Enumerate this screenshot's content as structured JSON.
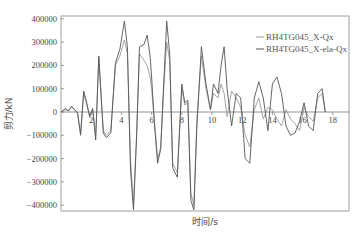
{
  "chart_data": {
    "type": "line",
    "title": "",
    "xlabel": "时间/s",
    "ylabel": "剪力/kN",
    "xlim": [
      0,
      19
    ],
    "ylim": [
      -450000,
      410000
    ],
    "x_ticks": [
      "2",
      "4",
      "6",
      "8",
      "10",
      "12",
      "14",
      "16",
      "18"
    ],
    "y_ticks": [
      "400000",
      "300000",
      "200000",
      "100000",
      "0",
      "-100000",
      "-200000",
      "-300000",
      "-400000"
    ],
    "grid": false,
    "legend_position": "upper right",
    "series": [
      {
        "name": "RH4TG045_X-Qx",
        "color": "#9a9a9a",
        "x": [
          0,
          0.3,
          0.5,
          0.7,
          0.9,
          1.1,
          1.3,
          1.5,
          1.7,
          1.9,
          2.1,
          2.3,
          2.5,
          2.8,
          3.0,
          3.3,
          3.6,
          3.9,
          4.2,
          4.4,
          4.6,
          4.8,
          5.0,
          5.2,
          5.5,
          5.7,
          5.9,
          6.0,
          6.2,
          6.4,
          6.6,
          6.8,
          7.0,
          7.2,
          7.4,
          7.7,
          8.0,
          8.2,
          8.4,
          8.6,
          8.8,
          9.0,
          9.3,
          9.6,
          9.9,
          10.1,
          10.4,
          10.6,
          10.8,
          11.0,
          11.3,
          11.6,
          11.9,
          12.2,
          12.5,
          12.8,
          13.1,
          13.4,
          13.7,
          14.0,
          14.3,
          14.6,
          14.9,
          15.2,
          15.5,
          15.8,
          16.1,
          16.4,
          16.7,
          17.0,
          17.3,
          17.5
        ],
        "y": [
          0,
          10000,
          5000,
          20000,
          10000,
          -5000,
          -90000,
          80000,
          30000,
          -20000,
          10000,
          -100000,
          230000,
          -80000,
          -100000,
          -80000,
          200000,
          240000,
          310000,
          250000,
          -200000,
          -400000,
          -100000,
          250000,
          220000,
          200000,
          150000,
          100000,
          -50000,
          -200000,
          -150000,
          100000,
          300000,
          220000,
          -220000,
          -260000,
          100000,
          30000,
          40000,
          -350000,
          -400000,
          -30000,
          240000,
          100000,
          10000,
          80000,
          60000,
          120000,
          80000,
          -20000,
          90000,
          60000,
          20000,
          -100000,
          -150000,
          10000,
          60000,
          -30000,
          20000,
          10000,
          -30000,
          -60000,
          10000,
          -30000,
          -50000,
          -80000,
          20000,
          -20000,
          -40000,
          60000,
          80000,
          0
        ]
      },
      {
        "name": "RH4TG045_X-ela-Qx",
        "color": "#555555",
        "x": [
          0,
          0.3,
          0.5,
          0.7,
          0.9,
          1.1,
          1.3,
          1.5,
          1.7,
          1.9,
          2.1,
          2.3,
          2.5,
          2.8,
          3.0,
          3.3,
          3.6,
          3.9,
          4.2,
          4.4,
          4.6,
          4.8,
          5.0,
          5.2,
          5.5,
          5.7,
          5.9,
          6.0,
          6.2,
          6.4,
          6.6,
          6.8,
          7.0,
          7.2,
          7.4,
          7.7,
          8.0,
          8.2,
          8.4,
          8.6,
          8.8,
          9.0,
          9.3,
          9.6,
          9.9,
          10.1,
          10.4,
          10.6,
          10.8,
          11.0,
          11.3,
          11.6,
          11.9,
          12.2,
          12.5,
          12.8,
          13.1,
          13.4,
          13.7,
          14.0,
          14.3,
          14.6,
          14.9,
          15.2,
          15.5,
          15.8,
          16.1,
          16.4,
          16.7,
          17.0,
          17.3,
          17.5
        ],
        "y": [
          0,
          15000,
          5000,
          25000,
          10000,
          -5000,
          -100000,
          90000,
          40000,
          -20000,
          15000,
          -120000,
          240000,
          -90000,
          -110000,
          -90000,
          210000,
          270000,
          390000,
          280000,
          -250000,
          -420000,
          -120000,
          280000,
          290000,
          330000,
          240000,
          150000,
          -60000,
          -220000,
          -160000,
          120000,
          390000,
          250000,
          -240000,
          -280000,
          120000,
          40000,
          50000,
          -380000,
          -420000,
          -60000,
          280000,
          120000,
          10000,
          120000,
          80000,
          200000,
          280000,
          100000,
          -60000,
          80000,
          60000,
          -200000,
          -220000,
          60000,
          130000,
          60000,
          -80000,
          120000,
          150000,
          80000,
          -60000,
          -100000,
          -90000,
          -40000,
          40000,
          -60000,
          -80000,
          80000,
          100000,
          0
        ]
      }
    ]
  },
  "legend": {
    "items": [
      {
        "label": "RH4TG045_X-Qx",
        "color": "#9a9a9a"
      },
      {
        "label": "RH4TG045_X-ela-Qx",
        "color": "#555555"
      }
    ]
  },
  "axes": {
    "xlabel": "时间/s",
    "ylabel": "剪力/kN"
  }
}
